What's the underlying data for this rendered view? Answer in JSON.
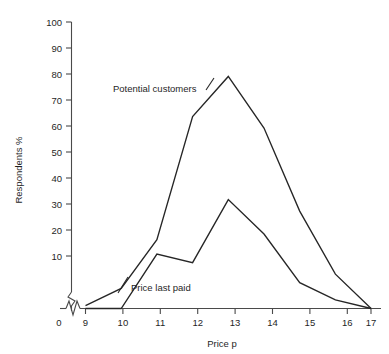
{
  "chart_data": {
    "type": "line",
    "title": "",
    "subtitle": "",
    "xlabel": "Price p",
    "ylabel": "Respondents %",
    "xlim": [
      9,
      17
    ],
    "ylim": [
      0,
      100
    ],
    "x_ticks": [
      "0",
      "9",
      "10",
      "11",
      "12",
      "13",
      "14",
      "15",
      "16",
      "17"
    ],
    "y_ticks": [
      "0",
      "10",
      "20",
      "30",
      "40",
      "50",
      "60",
      "70",
      "80",
      "90",
      "100"
    ],
    "x_axis_break": true,
    "y_axis_break": true,
    "grid": false,
    "legend_position": "inline-annotations",
    "x": [
      9,
      10,
      11,
      12,
      13,
      14,
      15,
      16,
      17
    ],
    "series": [
      {
        "name": "Potential customers",
        "values": [
          1,
          7,
          24,
          67,
          81,
          63,
          34,
          12,
          0
        ],
        "color": "#262626"
      },
      {
        "name": "Price last paid",
        "values": [
          0,
          0,
          19,
          16,
          38,
          26,
          9,
          3,
          0
        ],
        "color": "#262626"
      }
    ],
    "annotations": [
      {
        "text": "Potential customers",
        "series": "Potential customers"
      },
      {
        "text": "Price last paid",
        "series": "Price last paid"
      }
    ]
  },
  "axes": {
    "y_title": "Respondents %",
    "x_title": "Price p",
    "y_tick_labels": [
      "100",
      "90",
      "80",
      "70",
      "60",
      "50",
      "40",
      "30",
      "20",
      "10"
    ],
    "x_origin_label": "0",
    "x_tick_labels": [
      "9",
      "10",
      "11",
      "12",
      "13",
      "14",
      "15",
      "16",
      "17"
    ]
  },
  "labels": {
    "potential_customers": "Potential customers",
    "price_last_paid": "Price last paid"
  }
}
